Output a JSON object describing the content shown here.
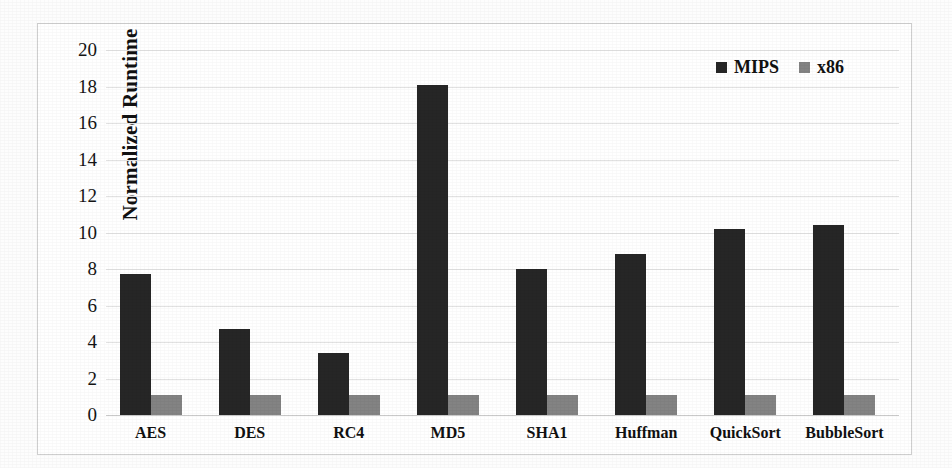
{
  "chart_data": {
    "type": "bar",
    "title": "",
    "xlabel": "",
    "ylabel": "Normalized Runtime",
    "ylim": [
      0,
      20
    ],
    "ytick_step": 2,
    "yticks": [
      "20",
      "18",
      "16",
      "14",
      "12",
      "10",
      "8",
      "6",
      "4",
      "2",
      "0"
    ],
    "grid": true,
    "legend_position": "top-right",
    "categories": [
      "AES",
      "DES",
      "RC4",
      "MD5",
      "SHA1",
      "Huffman",
      "QuickSort",
      "BubbleSort"
    ],
    "series": [
      {
        "name": "MIPS",
        "color": "#262626",
        "values": [
          7.7,
          4.7,
          3.4,
          18.1,
          8.0,
          8.8,
          10.2,
          10.4
        ]
      },
      {
        "name": "x86",
        "color": "#838383",
        "values": [
          1.1,
          1.1,
          1.1,
          1.1,
          1.1,
          1.1,
          1.1,
          1.1
        ]
      }
    ]
  },
  "legend": {
    "items": [
      {
        "label": "MIPS",
        "swatch": "legend-swatch-mips",
        "color": "#262626"
      },
      {
        "label": "x86",
        "swatch": "legend-swatch-x86",
        "color": "#838383"
      }
    ]
  },
  "axes": {
    "y_title": "Normalized Runtime"
  }
}
